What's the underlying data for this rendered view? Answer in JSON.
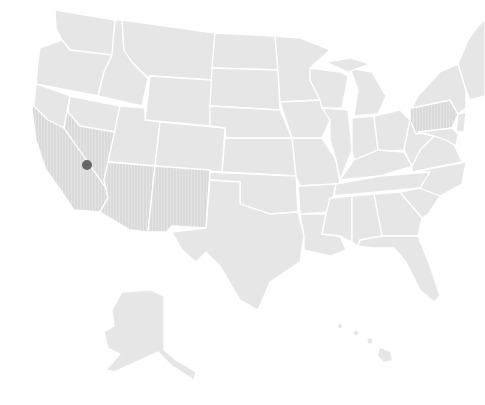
{
  "map": {
    "type": "us-states-choropleth",
    "colors": {
      "background": "#ffffff",
      "land": "#e6e6e6",
      "border": "#ffffff",
      "hatch_line": "#d2d2d2",
      "marker": "#666666"
    },
    "highlighted_region": {
      "description": "hatched zone across southwest (California, Nevada, Arizona, New Mexico) plus Pennsylvania",
      "pattern": "vertical-hatch"
    },
    "marker": {
      "shape": "dot",
      "location_description": "California–Nevada border, east-central California",
      "x": 87,
      "y": 165,
      "radius": 5
    },
    "insets": [
      "Alaska",
      "Hawaii"
    ]
  }
}
